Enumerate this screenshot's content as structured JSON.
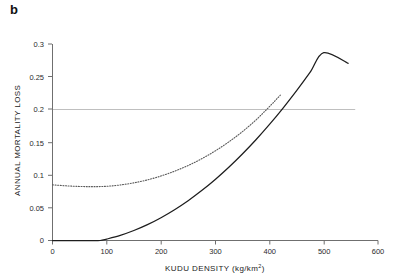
{
  "panel": {
    "label": "b"
  },
  "chart_data": {
    "type": "line",
    "title": "",
    "xlabel": "KUDU DENSITY (kg/km²)",
    "xlabel_base": "KUDU DENSITY (kg/km",
    "xlabel_sup": "2",
    "xlabel_tail": ")",
    "ylabel": "ANNUAL MORTALITY LOSS",
    "xlim": [
      0,
      600
    ],
    "ylim": [
      0,
      0.3
    ],
    "xticks": [
      0,
      100,
      200,
      300,
      400,
      500,
      600
    ],
    "xtick_labels": [
      "0",
      "100",
      "200",
      "300",
      "400",
      "500",
      "600"
    ],
    "yticks": [
      0,
      0.05,
      0.1,
      0.15,
      0.2,
      0.25,
      0.3
    ],
    "ytick_labels": [
      "0",
      "0.05",
      "0.1",
      "0.15",
      "0.2",
      "0.25",
      "0.3"
    ],
    "grid": "horizontal-reference-line-at-0.2",
    "reference_lines": [
      {
        "name": "threshold-0.2",
        "y": 0.2,
        "x_from": 0,
        "x_to": 558,
        "style": "solid-grey"
      }
    ],
    "legend": "none",
    "annotations": [],
    "series": [
      {
        "name": "upper-dotted-curve",
        "style": "dotted",
        "color": "#5a5a5a",
        "x": [
          0,
          25,
          50,
          75,
          100,
          125,
          150,
          175,
          200,
          225,
          250,
          275,
          300,
          325,
          350,
          375,
          400,
          420
        ],
        "y": [
          0.085,
          0.0835,
          0.0825,
          0.0822,
          0.0828,
          0.0848,
          0.088,
          0.0925,
          0.0985,
          0.1058,
          0.1145,
          0.1248,
          0.1368,
          0.1505,
          0.1662,
          0.184,
          0.2045,
          0.222
        ],
        "crosses_reference_at_x": 342
      },
      {
        "name": "lower-solid-curve",
        "style": "solid",
        "color": "#1d1d1d",
        "x": [
          0,
          25,
          50,
          75,
          88,
          100,
          125,
          150,
          175,
          200,
          225,
          250,
          275,
          300,
          325,
          350,
          375,
          400,
          425,
          450,
          475,
          500,
          525,
          545
        ],
        "y": [
          0,
          0,
          0,
          0,
          0,
          0.0022,
          0.0078,
          0.0152,
          0.0242,
          0.0348,
          0.047,
          0.0608,
          0.0762,
          0.0932,
          0.1118,
          0.132,
          0.1538,
          0.1772,
          0.2022,
          0.2288,
          0.257,
          0.2868,
          0.318,
          0.2705
        ],
        "crosses_reference_at_x": 484
      }
    ]
  }
}
